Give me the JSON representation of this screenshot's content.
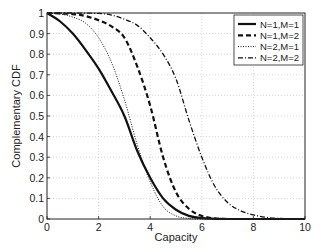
{
  "chart_data": {
    "type": "line",
    "title": "",
    "xlabel": "Capacity",
    "ylabel": "Complementary CDF",
    "xlim": [
      0,
      10
    ],
    "ylim": [
      0,
      1
    ],
    "xticks": [
      "0",
      "2",
      "4",
      "6",
      "8",
      "10"
    ],
    "yticks": [
      "0",
      "0.1",
      "0.2",
      "0.3",
      "0.4",
      "0.5",
      "0.6",
      "0.7",
      "0.8",
      "0.9",
      "1"
    ],
    "grid": true,
    "legend_position": "upper right",
    "series": [
      {
        "name": "N=1,M=1",
        "style": "solid",
        "x": [
          0,
          0.5,
          1,
          1.5,
          2,
          2.5,
          3,
          3.5,
          4,
          4.5,
          5,
          5.5,
          6,
          7,
          8,
          10
        ],
        "y": [
          1,
          0.96,
          0.9,
          0.82,
          0.73,
          0.62,
          0.5,
          0.33,
          0.2,
          0.1,
          0.045,
          0.015,
          0.004,
          0,
          0,
          0
        ]
      },
      {
        "name": "N=1,M=2",
        "style": "dashed",
        "x": [
          0,
          1,
          1.5,
          2,
          2.5,
          3,
          3.5,
          4,
          4.5,
          5,
          5.5,
          6,
          6.5,
          7,
          10
        ],
        "y": [
          1,
          0.995,
          0.985,
          0.965,
          0.935,
          0.88,
          0.74,
          0.55,
          0.3,
          0.13,
          0.05,
          0.015,
          0.003,
          0,
          0
        ]
      },
      {
        "name": "N=2,M=1",
        "style": "dotted",
        "x": [
          0,
          0.5,
          1,
          1.5,
          2,
          2.5,
          3,
          3.5,
          4,
          4.5,
          5,
          5.5,
          6,
          10
        ],
        "y": [
          1,
          0.995,
          0.98,
          0.95,
          0.88,
          0.76,
          0.58,
          0.36,
          0.18,
          0.06,
          0.015,
          0.003,
          0,
          0
        ]
      },
      {
        "name": "N=2,M=2",
        "style": "dashdot",
        "x": [
          0,
          1,
          2,
          2.5,
          3,
          3.5,
          4,
          4.5,
          5,
          5.5,
          6,
          6.5,
          7,
          7.5,
          8,
          8.5,
          9,
          10
        ],
        "y": [
          1,
          1,
          0.998,
          0.99,
          0.97,
          0.94,
          0.88,
          0.8,
          0.68,
          0.48,
          0.3,
          0.16,
          0.08,
          0.04,
          0.02,
          0.008,
          0.003,
          0
        ]
      }
    ]
  }
}
